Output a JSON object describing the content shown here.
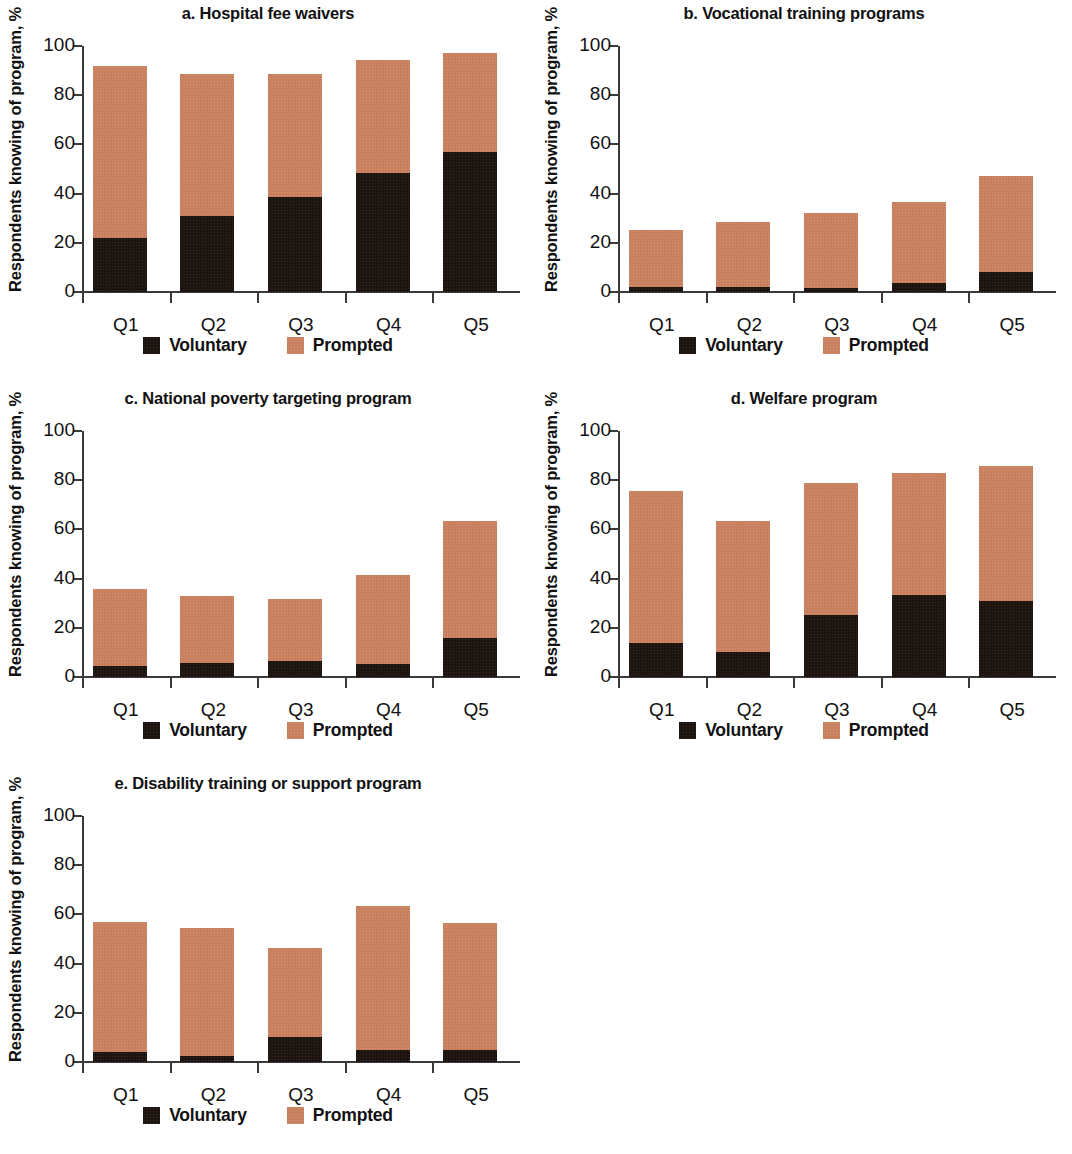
{
  "figure": {
    "ylabel": "Respondents knowing of program, %",
    "yticks": [
      0,
      20,
      40,
      60,
      80,
      100
    ],
    "xticks": [
      "Q1",
      "Q2",
      "Q3",
      "Q4",
      "Q5"
    ],
    "legend": {
      "voluntary_label": "Voluntary",
      "prompted_label": "Prompted"
    },
    "colors": {
      "voluntary": "#1d1410",
      "prompted": "#c9805f",
      "axis": "#3a3a3a",
      "text": "#111111",
      "background": "#ffffff"
    }
  },
  "chart_data": [
    {
      "type": "bar",
      "panel": "a",
      "title": "a. Hospital fee waivers",
      "stacked": true,
      "categories": [
        "Q1",
        "Q2",
        "Q3",
        "Q4",
        "Q5"
      ],
      "series": [
        {
          "name": "Voluntary",
          "values": [
            21.8,
            31.0,
            38.5,
            48.5,
            57.0
          ]
        },
        {
          "name": "Prompted",
          "values": [
            70.0,
            57.8,
            50.2,
            45.7,
            40.0
          ]
        }
      ],
      "totals": [
        91.8,
        88.8,
        88.7,
        94.2,
        97.0
      ],
      "xlabel": "",
      "ylabel": "Respondents knowing of program, %",
      "ylim": [
        0,
        100
      ],
      "grid": false,
      "legend_position": "bottom"
    },
    {
      "type": "bar",
      "panel": "b",
      "title": "b. Vocational training programs",
      "stacked": true,
      "categories": [
        "Q1",
        "Q2",
        "Q3",
        "Q4",
        "Q5"
      ],
      "series": [
        {
          "name": "Voluntary",
          "values": [
            2.2,
            2.2,
            1.8,
            3.5,
            8.0
          ]
        },
        {
          "name": "Prompted",
          "values": [
            23.2,
            26.2,
            30.2,
            33.2,
            39.0
          ]
        }
      ],
      "totals": [
        25.4,
        28.4,
        32.0,
        36.7,
        47.0
      ],
      "xlabel": "",
      "ylabel": "Respondents knowing of program, %",
      "ylim": [
        0,
        100
      ],
      "grid": false,
      "legend_position": "bottom"
    },
    {
      "type": "bar",
      "panel": "c",
      "title": "c. National poverty targeting program",
      "stacked": true,
      "categories": [
        "Q1",
        "Q2",
        "Q3",
        "Q4",
        "Q5"
      ],
      "series": [
        {
          "name": "Voluntary",
          "values": [
            4.3,
            5.5,
            6.5,
            5.2,
            15.7
          ]
        },
        {
          "name": "Prompted",
          "values": [
            31.3,
            27.3,
            25.1,
            36.2,
            47.6
          ]
        }
      ],
      "totals": [
        35.6,
        32.8,
        31.6,
        41.4,
        63.3
      ],
      "xlabel": "",
      "ylabel": "Respondents knowing of program, %",
      "ylim": [
        0,
        100
      ],
      "grid": false,
      "legend_position": "bottom"
    },
    {
      "type": "bar",
      "panel": "d",
      "title": "d. Welfare program",
      "stacked": true,
      "categories": [
        "Q1",
        "Q2",
        "Q3",
        "Q4",
        "Q5"
      ],
      "series": [
        {
          "name": "Voluntary",
          "values": [
            13.8,
            10.2,
            25.2,
            33.5,
            31.0
          ]
        },
        {
          "name": "Prompted",
          "values": [
            61.9,
            53.2,
            53.5,
            49.5,
            54.9
          ]
        }
      ],
      "totals": [
        75.7,
        63.4,
        78.7,
        83.0,
        85.9
      ],
      "xlabel": "",
      "ylabel": "Respondents knowing of program, %",
      "ylim": [
        0,
        100
      ],
      "grid": false,
      "legend_position": "bottom"
    },
    {
      "type": "bar",
      "panel": "e",
      "title": "e. Disability training or support program",
      "stacked": true,
      "categories": [
        "Q1",
        "Q2",
        "Q3",
        "Q4",
        "Q5"
      ],
      "series": [
        {
          "name": "Voluntary",
          "values": [
            4.0,
            2.5,
            10.0,
            5.0,
            4.7
          ]
        },
        {
          "name": "Prompted",
          "values": [
            52.8,
            51.8,
            36.5,
            58.4,
            52.0
          ]
        }
      ],
      "totals": [
        56.8,
        54.3,
        46.5,
        63.4,
        56.7
      ],
      "xlabel": "",
      "ylabel": "Respondents knowing of program, %",
      "ylim": [
        0,
        100
      ],
      "grid": false,
      "legend_position": "bottom"
    }
  ]
}
